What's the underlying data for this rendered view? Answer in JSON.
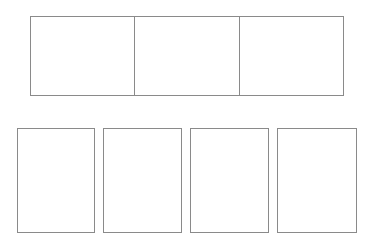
{
  "top_strip": {
    "cells": [
      {
        "label": ""
      },
      {
        "label": ""
      },
      {
        "label": ""
      }
    ]
  },
  "bottom_cards": [
    {
      "label": "",
      "left": 17,
      "width": 78
    },
    {
      "label": "",
      "left": 103,
      "width": 79
    },
    {
      "label": "",
      "left": 190,
      "width": 79
    },
    {
      "label": "",
      "left": 277,
      "width": 80
    }
  ],
  "colors": {
    "border": "#8a8a8a",
    "background": "#ffffff"
  }
}
